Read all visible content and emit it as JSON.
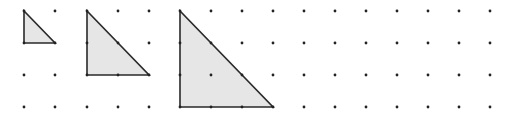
{
  "grid": {
    "columns_x": [
      24,
      55,
      87,
      118,
      149,
      180,
      211,
      242,
      273,
      304,
      335,
      366,
      397,
      428,
      459,
      490
    ],
    "rows_y": [
      11,
      43,
      75,
      107
    ],
    "dot_color": "#222222",
    "dot_radius": 1.4
  },
  "triangles": [
    {
      "name": "triangle-small",
      "points": [
        [
          24,
          11
        ],
        [
          24,
          43
        ],
        [
          55,
          43
        ]
      ]
    },
    {
      "name": "triangle-medium",
      "points": [
        [
          87,
          11
        ],
        [
          87,
          75
        ],
        [
          149,
          75
        ]
      ]
    },
    {
      "name": "triangle-large",
      "points": [
        [
          180,
          11
        ],
        [
          180,
          107
        ],
        [
          273,
          107
        ]
      ]
    }
  ],
  "style": {
    "fill": "#e6e6e6",
    "stroke": "#2a2a2a",
    "stroke_width": 1.6
  }
}
